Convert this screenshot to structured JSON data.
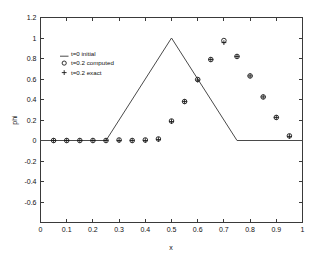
{
  "figure": {
    "background_color": "#ffffff",
    "frame_color": "#3a3a3a",
    "line_color": "#4a4a4a",
    "marker_color": "#1a1a1a"
  },
  "chart_data": {
    "type": "line",
    "title": "",
    "xlabel": "x",
    "ylabel": "phi",
    "xlim": [
      0,
      1
    ],
    "ylim": [
      -0.8,
      1.2
    ],
    "grid": false,
    "legend_position": "upper-left-inside",
    "xticks": [
      0,
      0.1,
      0.2,
      0.3,
      0.4,
      0.5,
      0.6,
      0.7,
      0.8,
      0.9,
      1
    ],
    "xticklabels": [
      "0",
      "0.1",
      "0.2",
      "0.3",
      "0.4",
      "0.5",
      "0.6",
      "0.7",
      "0.8",
      "0.9",
      "1"
    ],
    "yticks": [
      -0.6,
      -0.4,
      -0.2,
      0,
      0.2,
      0.4,
      0.6,
      0.8,
      1,
      1.2
    ],
    "yticklabels": [
      "-0.6",
      "-0.4",
      "-0.2",
      "0",
      "0.2",
      "0.4",
      "0.6",
      "0.8",
      "1",
      "1.2"
    ],
    "series": [
      {
        "name": "t=0 initial",
        "marker": "line",
        "style": "solid",
        "x": [
          0,
          0.25,
          0.5,
          0.75,
          1
        ],
        "values": [
          0,
          0,
          1,
          0,
          0
        ]
      },
      {
        "name": "t=0.2 computed",
        "marker": "circle",
        "style": "none",
        "x": [
          0.05,
          0.1,
          0.15,
          0.2,
          0.25,
          0.3,
          0.35,
          0.4,
          0.45,
          0.5,
          0.55,
          0.6,
          0.65,
          0.7,
          0.75,
          0.8,
          0.85,
          0.9,
          0.95
        ],
        "values": [
          0,
          0,
          0,
          0,
          0,
          0.005,
          0,
          0.005,
          0.015,
          0.19,
          0.38,
          0.595,
          0.79,
          0.975,
          0.82,
          0.63,
          0.425,
          0.225,
          0.045
        ]
      },
      {
        "name": "t=0.2 exact",
        "marker": "plus",
        "style": "none",
        "x": [
          0.05,
          0.1,
          0.15,
          0.2,
          0.25,
          0.3,
          0.35,
          0.4,
          0.45,
          0.5,
          0.55,
          0.6,
          0.65,
          0.7,
          0.75,
          0.8,
          0.85,
          0.9,
          0.95
        ],
        "values": [
          0,
          0,
          0,
          0,
          0,
          0,
          0,
          0,
          0.01,
          0.185,
          0.38,
          0.59,
          0.79,
          0.955,
          0.82,
          0.63,
          0.425,
          0.225,
          0.04
        ]
      }
    ],
    "legend": [
      {
        "label": "t=0 initial",
        "marker": "line"
      },
      {
        "label": "t=0.2 computed",
        "marker": "circle"
      },
      {
        "label": "t=0.2 exact",
        "marker": "plus"
      }
    ]
  }
}
